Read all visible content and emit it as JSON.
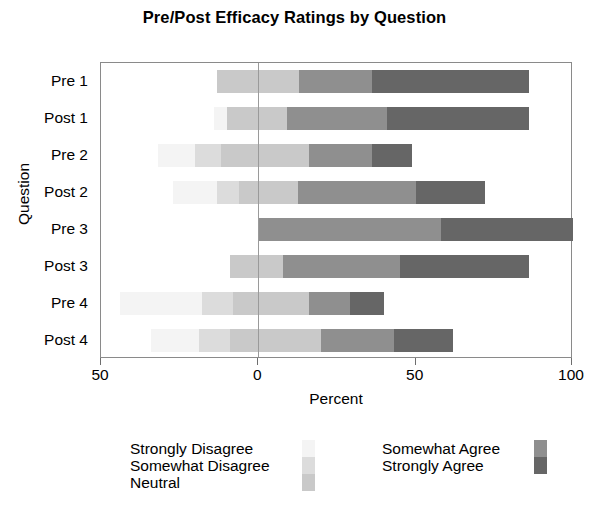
{
  "chart_data": {
    "type": "bar",
    "subtype": "diverging-stacked-likert",
    "title": "Pre/Post Efficacy Ratings by Question",
    "xlabel": "Percent",
    "ylabel": "Question",
    "xlim": [
      -50,
      100
    ],
    "xticks": [
      -50,
      0,
      50,
      100
    ],
    "xticklabels": [
      "50",
      "0",
      "50",
      "100"
    ],
    "grid": false,
    "legend_position": "bottom",
    "categories": [
      "Pre 1",
      "Post 1",
      "Pre 2",
      "Post 2",
      "Pre 3",
      "Post 3",
      "Pre 4",
      "Post 4"
    ],
    "series": [
      {
        "name": "Strongly Disagree",
        "color": "#f4f4f4",
        "values": [
          0,
          4,
          12,
          14,
          0,
          0,
          26,
          15
        ]
      },
      {
        "name": "Somewhat Disagree",
        "color": "#dcdcdc",
        "values": [
          0,
          0,
          8,
          7,
          0,
          0,
          10,
          10
        ]
      },
      {
        "name": "Neutral",
        "color": "#c9c9c9",
        "values": [
          26,
          19,
          28,
          19,
          0,
          17,
          24,
          29
        ]
      },
      {
        "name": "Somewhat Agree",
        "color": "#8f8f8f",
        "values": [
          23,
          32,
          20,
          38,
          58,
          37,
          13,
          23
        ]
      },
      {
        "name": "Strongly Agree",
        "color": "#666666",
        "values": [
          50,
          45,
          13,
          22,
          42,
          41,
          11,
          19
        ]
      }
    ],
    "bars": [
      {
        "category": "Pre 1",
        "start_pct": -13,
        "end_pct": 86,
        "segments": [
          {
            "name": "Strongly Disagree",
            "value": 0
          },
          {
            "name": "Somewhat Disagree",
            "value": 0
          },
          {
            "name": "Neutral",
            "value": 26
          },
          {
            "name": "Somewhat Agree",
            "value": 23
          },
          {
            "name": "Strongly Agree",
            "value": 50
          }
        ]
      },
      {
        "category": "Post 1",
        "start_pct": -14,
        "end_pct": 86,
        "segments": [
          {
            "name": "Strongly Disagree",
            "value": 4
          },
          {
            "name": "Somewhat Disagree",
            "value": 0
          },
          {
            "name": "Neutral",
            "value": 19
          },
          {
            "name": "Somewhat Agree",
            "value": 32
          },
          {
            "name": "Strongly Agree",
            "value": 45
          }
        ]
      },
      {
        "category": "Pre 2",
        "start_pct": -32,
        "end_pct": 53,
        "segments": [
          {
            "name": "Strongly Disagree",
            "value": 12
          },
          {
            "name": "Somewhat Disagree",
            "value": 8
          },
          {
            "name": "Neutral",
            "value": 28
          },
          {
            "name": "Somewhat Agree",
            "value": 20
          },
          {
            "name": "Strongly Agree",
            "value": 13
          }
        ]
      },
      {
        "category": "Post 2",
        "start_pct": -27,
        "end_pct": 72,
        "segments": [
          {
            "name": "Strongly Disagree",
            "value": 14
          },
          {
            "name": "Somewhat Disagree",
            "value": 7
          },
          {
            "name": "Neutral",
            "value": 19
          },
          {
            "name": "Somewhat Agree",
            "value": 38
          },
          {
            "name": "Strongly Agree",
            "value": 22
          }
        ]
      },
      {
        "category": "Pre 3",
        "start_pct": 0,
        "end_pct": 100,
        "segments": [
          {
            "name": "Strongly Disagree",
            "value": 0
          },
          {
            "name": "Somewhat Disagree",
            "value": 0
          },
          {
            "name": "Neutral",
            "value": 0
          },
          {
            "name": "Somewhat Agree",
            "value": 58
          },
          {
            "name": "Strongly Agree",
            "value": 42
          }
        ]
      },
      {
        "category": "Post 3",
        "start_pct": -9,
        "end_pct": 86,
        "segments": [
          {
            "name": "Strongly Disagree",
            "value": 0
          },
          {
            "name": "Somewhat Disagree",
            "value": 0
          },
          {
            "name": "Neutral",
            "value": 17
          },
          {
            "name": "Somewhat Agree",
            "value": 37
          },
          {
            "name": "Strongly Agree",
            "value": 41
          }
        ]
      },
      {
        "category": "Pre 4",
        "start_pct": -44,
        "end_pct": 42,
        "segments": [
          {
            "name": "Strongly Disagree",
            "value": 26
          },
          {
            "name": "Somewhat Disagree",
            "value": 10
          },
          {
            "name": "Neutral",
            "value": 24
          },
          {
            "name": "Somewhat Agree",
            "value": 13
          },
          {
            "name": "Strongly Agree",
            "value": 11
          }
        ]
      },
      {
        "category": "Post 4",
        "start_pct": -34,
        "end_pct": 62,
        "segments": [
          {
            "name": "Strongly Disagree",
            "value": 15
          },
          {
            "name": "Somewhat Disagree",
            "value": 10
          },
          {
            "name": "Neutral",
            "value": 29
          },
          {
            "name": "Somewhat Agree",
            "value": 23
          },
          {
            "name": "Strongly Agree",
            "value": 19
          }
        ]
      }
    ],
    "legend": {
      "left_column": [
        "Strongly Disagree",
        "Somewhat Disagree",
        "Neutral"
      ],
      "right_column": [
        "Somewhat Agree",
        "Strongly Agree"
      ]
    }
  }
}
